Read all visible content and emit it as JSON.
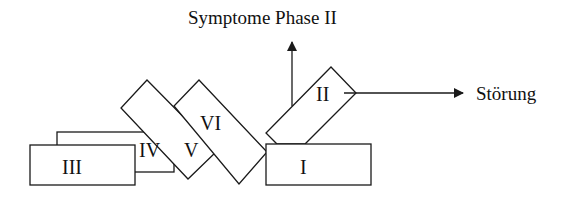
{
  "diagram": {
    "title": "Symptome Phase II",
    "axis_right_label": "Störung",
    "boxes": {
      "I": "I",
      "II": "II",
      "III": "III",
      "IV": "IV",
      "V": "V",
      "VI": "VI"
    },
    "colors": {
      "stroke": "#1a1a1a",
      "fill": "#ffffff",
      "background": "#ffffff"
    }
  }
}
